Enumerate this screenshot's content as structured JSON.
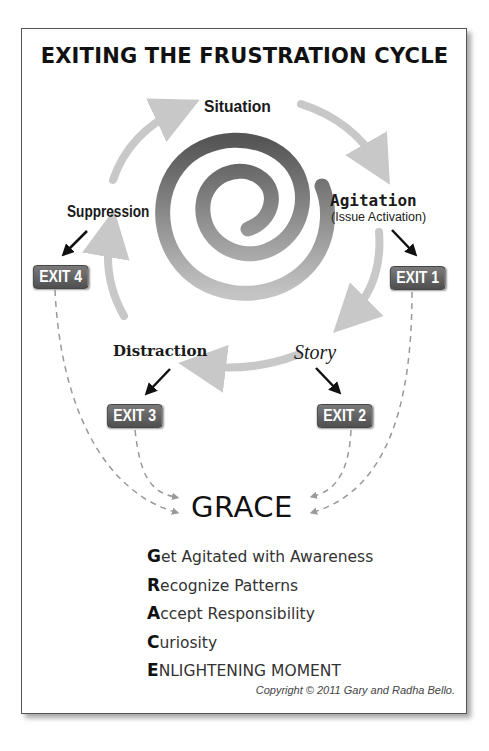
{
  "title": "EXITING THE FRUSTRATION CYCLE",
  "cycle": {
    "stages": [
      {
        "id": "situation",
        "label": "Situation"
      },
      {
        "id": "agitation",
        "label": "Agitation",
        "sublabel": "(Issue Activation)"
      },
      {
        "id": "story",
        "label": "Story"
      },
      {
        "id": "distraction",
        "label": "Distraction"
      },
      {
        "id": "suppression",
        "label": "Suppression"
      }
    ],
    "center_graphic": "spiral-icon"
  },
  "exits": [
    {
      "id": "exit1",
      "label": "EXIT 1",
      "from": "Agitation"
    },
    {
      "id": "exit2",
      "label": "EXIT 2",
      "from": "Story"
    },
    {
      "id": "exit3",
      "label": "EXIT 3",
      "from": "Distraction"
    },
    {
      "id": "exit4",
      "label": "EXIT 4",
      "from": "Suppression"
    }
  ],
  "destination": "GRACE",
  "acronym": [
    {
      "letter": "G",
      "rest": "et Agitated with Awareness"
    },
    {
      "letter": "R",
      "rest": "ecognize Patterns"
    },
    {
      "letter": "A",
      "rest": "ccept Responsibility"
    },
    {
      "letter": "C",
      "rest": "uriosity"
    },
    {
      "letter": "E",
      "rest": "NLIGHTENING MOMENT"
    }
  ],
  "copyright": "Copyright © 2011 Gary and Radha Bello.",
  "colors": {
    "cycle_arrow": "#c8c8c8",
    "exit_badge": "#5f5f5f",
    "dashed_line": "#999999",
    "spiral_dark": "#555555",
    "spiral_light": "#bdbdbd"
  }
}
